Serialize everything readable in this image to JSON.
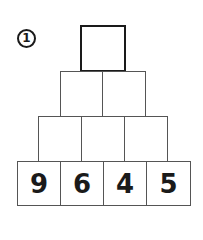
{
  "task": {
    "number": "1"
  },
  "pyramid": {
    "rows": [
      [
        ""
      ],
      [
        "",
        ""
      ],
      [
        "",
        "",
        ""
      ],
      [
        "9",
        "6",
        "4",
        "5"
      ]
    ]
  }
}
